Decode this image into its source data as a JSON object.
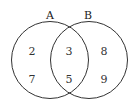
{
  "diagram": {
    "type": "venn",
    "sets": [
      {
        "label": "A",
        "only": [
          "2",
          "7"
        ]
      },
      {
        "label": "B",
        "only": [
          "8",
          "9"
        ]
      }
    ],
    "intersection": [
      "3",
      "5"
    ]
  },
  "colors": {
    "stroke": "#333333",
    "background": "#ffffff"
  }
}
